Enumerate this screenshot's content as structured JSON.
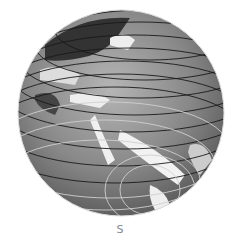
{
  "image": {
    "subject": "globe",
    "description": "Grayscale globe showing Europe, Africa, Middle East and Asia with latitude lines",
    "colors": {
      "ocean": "#8a8a8a",
      "land_light": "#f2f2f2",
      "land_dark": "#3a3a3a",
      "lines": "#1a1a1a"
    }
  },
  "label": {
    "text": "S"
  }
}
